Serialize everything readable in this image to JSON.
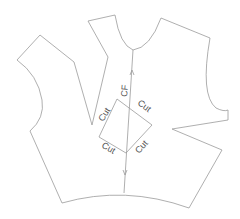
{
  "diagram": {
    "type": "sewing-pattern",
    "stroke_color": "#9a9a9a",
    "text_color": "#555555",
    "labels": {
      "center_front": "CF",
      "cut_top_left": "Cut",
      "cut_top_right": "Cut",
      "cut_bottom_left": "Cut",
      "cut_bottom_right": "Cut"
    }
  }
}
